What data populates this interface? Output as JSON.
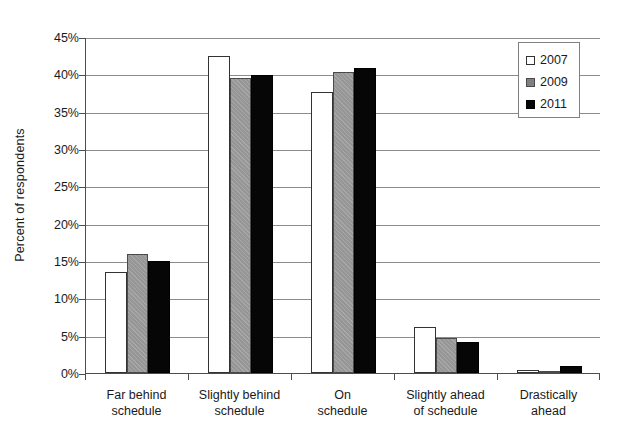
{
  "chart_data": {
    "type": "bar",
    "title": "",
    "xlabel": "",
    "ylabel": "Percent of respondents",
    "ylim": [
      0,
      45
    ],
    "ytick_step": 5,
    "ytick_labels": [
      "0%",
      "5%",
      "10%",
      "15%",
      "20%",
      "25%",
      "30%",
      "35%",
      "40%",
      "45%"
    ],
    "grid": true,
    "legend_position": "top-right",
    "categories": [
      "Far behind schedule",
      "Slightly behind schedule",
      "On schedule",
      "Slightly ahead of schedule",
      "Drastically ahead"
    ],
    "category_lines": [
      [
        "Far behind",
        "schedule"
      ],
      [
        "Slightly behind",
        "schedule"
      ],
      [
        "On",
        "schedule"
      ],
      [
        "Slightly ahead",
        "of schedule"
      ],
      [
        "Drastically",
        "ahead"
      ]
    ],
    "series": [
      {
        "name": "2007",
        "color": "#ffffff",
        "values": [
          13.5,
          42.5,
          37.7,
          6.2,
          0.4
        ]
      },
      {
        "name": "2009",
        "color": "#969696",
        "values": [
          15.9,
          39.5,
          40.3,
          4.7,
          0.3
        ]
      },
      {
        "name": "2011",
        "color": "#060606",
        "values": [
          15.0,
          39.9,
          40.8,
          4.1,
          0.9
        ]
      }
    ]
  },
  "legend": {
    "items": [
      {
        "label": "2007",
        "swatch": "legend-swatch-2007"
      },
      {
        "label": "2009",
        "swatch": "legend-swatch-2009"
      },
      {
        "label": "2011",
        "swatch": "legend-swatch-2011"
      }
    ]
  },
  "axes": {
    "y_title": "Percent of respondents"
  }
}
